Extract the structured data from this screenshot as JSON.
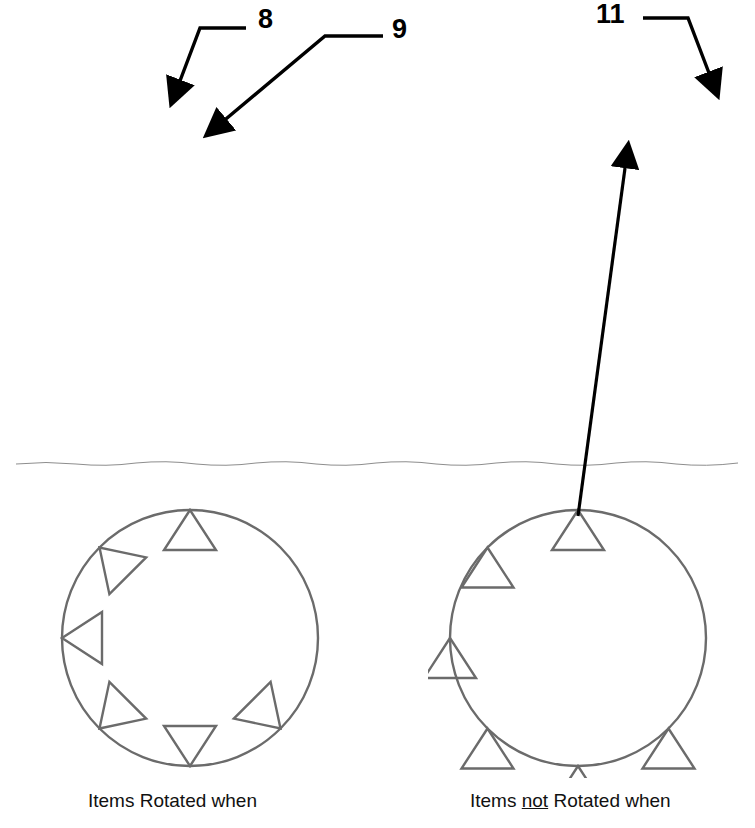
{
  "callouts": [
    {
      "id": "8",
      "label": "8"
    },
    {
      "id": "9",
      "label": "9"
    },
    {
      "id": "11",
      "label": "11"
    }
  ],
  "application": {
    "logo_letter": "A",
    "quick_access": [
      {
        "name": "new-icon",
        "title": "New"
      },
      {
        "name": "open-icon",
        "title": "Open"
      },
      {
        "name": "preview-icon",
        "title": "Plot Preview"
      },
      {
        "name": "save-icon",
        "title": "Save"
      },
      {
        "name": "saveas-icon",
        "title": "Save As"
      },
      {
        "name": "print-icon",
        "title": "Plot"
      },
      {
        "name": "undo-icon",
        "title": "Undo"
      },
      {
        "name": "redo-icon",
        "title": "Redo"
      }
    ],
    "qat_dropdown": "▾"
  },
  "ribbon": {
    "tabs": [
      {
        "label": "Home",
        "active": false
      },
      {
        "label": "Insert",
        "active": false
      },
      {
        "label": "Annotate",
        "active": false
      },
      {
        "label": "Parametric",
        "active": false
      },
      {
        "label": "View",
        "active": false
      },
      {
        "label": "Manage",
        "active": false
      },
      {
        "label": "Output",
        "active": false
      },
      {
        "label": "Add-ins",
        "active": false
      },
      {
        "label": "A360",
        "active": false
      },
      {
        "label": "Express Tools",
        "active": false
      },
      {
        "label": "Featured Apps",
        "active": false
      },
      {
        "label": "Array Creation",
        "active": true
      }
    ],
    "panels": {
      "type": {
        "label": "Type",
        "selected": "Polar"
      },
      "items": {
        "label": "Items",
        "rows": [
          {
            "icon": "items-icon",
            "label": "Items:",
            "value": "6"
          },
          {
            "icon": "angle-between-icon",
            "label": "Between:",
            "value": "45"
          },
          {
            "icon": "fill-angle-icon",
            "label": "Fill:",
            "value": "225"
          }
        ]
      },
      "rows": {
        "label": "Rows ▾",
        "rows": [
          {
            "icon": "rows-count-icon",
            "label": "Rows:",
            "value": "1"
          },
          {
            "icon": "rows-between-icon",
            "label": "Between:",
            "value": "1.125"
          },
          {
            "icon": "rows-total-icon",
            "label": "Total:",
            "value": "1.125"
          }
        ]
      },
      "levels": {
        "label": "Levels",
        "rows": [
          {
            "icon": "levels-count-icon",
            "label": "Levels:",
            "value": "1"
          },
          {
            "icon": "levels-between-icon",
            "label": "Between:",
            "value": "1.000"
          },
          {
            "icon": "levels-total-icon",
            "label": "Total:",
            "value": "1.000"
          }
        ]
      },
      "properties": {
        "label": "Properties",
        "buttons": [
          {
            "name": "associative-button",
            "label": "Associative",
            "active": true
          },
          {
            "name": "base-point-button",
            "label": "Base Point",
            "active": false
          },
          {
            "name": "rotate-items-button",
            "label": "Rotate Items",
            "active": true
          },
          {
            "name": "direction-button",
            "label": "Direction",
            "active": true
          }
        ]
      },
      "close": {
        "label": "Close",
        "button_line1": "Close",
        "button_line2": "Array",
        "icon": "close-x-icon"
      }
    }
  },
  "file_tabs": [
    {
      "label": "Start",
      "active": false,
      "closable": false
    },
    {
      "label": "polar array 13-8*",
      "active": true,
      "closable": true,
      "close_glyph": "✕"
    },
    {
      "label": "+",
      "active": false,
      "closable": false
    }
  ],
  "viewport": {
    "label": "[-][Top][2D Wireframe]",
    "array": {
      "item_count": 6,
      "angle_between_deg": 45,
      "fill_angle_deg": 225,
      "rotate_items": true,
      "has_grips": true
    }
  },
  "figures": [
    {
      "name": "rotated-example",
      "caption_prefix": "Items ",
      "caption_emphasis": "",
      "caption_suffix": "Rotated when",
      "rotate_items": true,
      "item_count": 6
    },
    {
      "name": "not-rotated-example",
      "caption_prefix": "Items ",
      "caption_emphasis": "not",
      "caption_suffix": " Rotated when",
      "rotate_items": false,
      "item_count": 6
    }
  ],
  "colors": {
    "ribbon_bg": "#f3f3f3",
    "titlebar_bg": "#9c9c9c",
    "active_tab_bg": "#f6f6f6",
    "panel_active": "#c9c9c9",
    "grip_gray": "#9a9a9a",
    "ink": "#111111"
  }
}
